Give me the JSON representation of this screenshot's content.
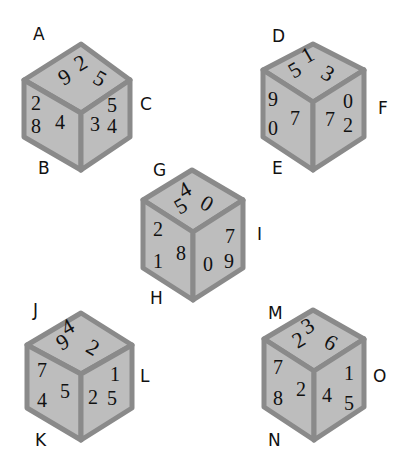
{
  "colors": {
    "face": "#bdbdbd",
    "edge": "#8a8a8a",
    "text": "#111111",
    "background": "#ffffff"
  },
  "cubes": [
    {
      "id": "cube-1",
      "corner_labels": {
        "top_left": "A",
        "bottom_left": "B",
        "right": "C"
      },
      "top_face": [
        "2",
        "5",
        "9"
      ],
      "left_face": [
        "2",
        "8",
        "4"
      ],
      "right_face": [
        "3",
        "5",
        "4"
      ]
    },
    {
      "id": "cube-2",
      "corner_labels": {
        "top_left": "D",
        "bottom_left": "E",
        "right": "F"
      },
      "top_face": [
        "1",
        "3",
        "5"
      ],
      "left_face": [
        "9",
        "0",
        "7"
      ],
      "right_face": [
        "7",
        "0",
        "2"
      ]
    },
    {
      "id": "cube-3",
      "corner_labels": {
        "top_left": "G",
        "bottom_left": "H",
        "right": "I"
      },
      "top_face": [
        "4",
        "0",
        "5"
      ],
      "left_face": [
        "2",
        "1",
        "8"
      ],
      "right_face": [
        "0",
        "7",
        "9"
      ]
    },
    {
      "id": "cube-4",
      "corner_labels": {
        "top_left": "J",
        "bottom_left": "K",
        "right": "L"
      },
      "top_face": [
        "4",
        "2",
        "9"
      ],
      "left_face": [
        "7",
        "4",
        "5"
      ],
      "right_face": [
        "2",
        "1",
        "5"
      ]
    },
    {
      "id": "cube-5",
      "corner_labels": {
        "top_left": "M",
        "bottom_left": "N",
        "right": "O"
      },
      "top_face": [
        "3",
        "6",
        "2"
      ],
      "left_face": [
        "7",
        "8",
        "2"
      ],
      "right_face": [
        "4",
        "1",
        "5"
      ]
    }
  ]
}
